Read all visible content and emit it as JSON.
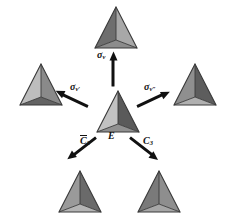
{
  "figure": {
    "type": "symmetry-operation-diagram",
    "background_color": "#ffffff",
    "ink_color": "#111111",
    "width": 226,
    "height": 219
  },
  "center": {
    "label_main": "E",
    "label_sub": "",
    "name": "identity-operation"
  },
  "operations": [
    {
      "id": "sigma-v",
      "main": "σ",
      "sub": "v",
      "overbar": false,
      "direction": "up",
      "target": "top"
    },
    {
      "id": "sigma-v-prime",
      "main": "σ",
      "sub": "v′",
      "overbar": false,
      "direction": "upper-left",
      "target": "left"
    },
    {
      "id": "sigma-v-double-prime",
      "main": "σ",
      "sub": "v″",
      "overbar": false,
      "direction": "upper-right",
      "target": "right"
    },
    {
      "id": "c3-bar",
      "main": "C",
      "sub": "3",
      "overbar": true,
      "direction": "lower-left",
      "target": "bottom-left"
    },
    {
      "id": "c3",
      "main": "C",
      "sub": "3",
      "overbar": false,
      "direction": "lower-right",
      "target": "bottom-right"
    }
  ],
  "tetrahedra": [
    {
      "id": "top",
      "position": "top",
      "face_left": "#6e6e6e",
      "face_right": "#a8a8a8",
      "face_front": "#8c8c8c",
      "edge": "#3a3a3a"
    },
    {
      "id": "left",
      "position": "left",
      "face_left": "#bdbdbd",
      "face_right": "#8a8a8a",
      "face_front": "#636363",
      "edge": "#3a3a3a"
    },
    {
      "id": "right",
      "position": "right",
      "face_left": "#8f8f8f",
      "face_right": "#5d5d5d",
      "face_front": "#b0b0b0",
      "edge": "#3a3a3a"
    },
    {
      "id": "center",
      "position": "center",
      "face_left": "#c2c2c2",
      "face_right": "#5a5a5a",
      "face_front": "#909090",
      "edge": "#3a3a3a"
    },
    {
      "id": "bottom-left",
      "position": "bottom-left",
      "face_left": "#9a9a9a",
      "face_right": "#6a6a6a",
      "face_front": "#b4b4b4",
      "edge": "#3a3a3a"
    },
    {
      "id": "bottom-right",
      "position": "bottom-right",
      "face_left": "#7a7a7a",
      "face_right": "#8e8e8e",
      "face_front": "#a6a6a6",
      "edge": "#3a3a3a"
    }
  ]
}
